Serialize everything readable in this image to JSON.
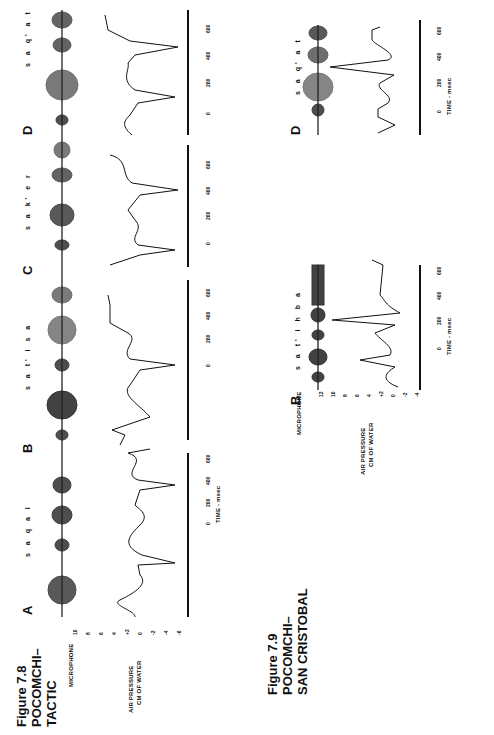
{
  "figure_7_8": {
    "title": "Figure 7.8\nPOCOMCHI–\nTACTIC",
    "microphone_label": "MICROPHONE",
    "pressure_label_1": "AIR  PRESSURE",
    "pressure_label_2": "CM OF WATER",
    "y_ticks": [
      "10",
      "8",
      "6",
      "4",
      "+2",
      "0",
      "-2",
      "-4",
      "-6"
    ],
    "time_label": "TIME - msec",
    "panels": [
      {
        "letter": "A",
        "transcription": "s a q a l",
        "time_ticks": [
          "0",
          "200",
          "400",
          "600"
        ]
      },
      {
        "letter": "B",
        "transcription": "s a t' i s a",
        "time_ticks": [
          "0",
          "200",
          "400",
          "600"
        ]
      },
      {
        "letter": "C",
        "transcription": "s a k' e r",
        "time_ticks": [
          "0",
          "200",
          "400",
          "600"
        ]
      },
      {
        "letter": "D",
        "transcription": "s a q' a t",
        "time_ticks": [
          "0",
          "200",
          "400",
          "600"
        ]
      }
    ]
  },
  "figure_7_9": {
    "title": "Figure 7.9\nPOCOMCHI–\nSAN CRISTOBAL",
    "microphone_label": "MICROPHONE",
    "pressure_label_1": "AIR  PRESSURE",
    "pressure_label_2": "CM OF WATER",
    "y_ticks": [
      "12",
      "10",
      "8",
      "6",
      "4",
      "+2",
      "0",
      "-2",
      "-4"
    ],
    "time_label": "TIME - msec",
    "panels": [
      {
        "letter": "B",
        "transcription": "s a t' i h b a",
        "time_ticks": [
          "0",
          "200",
          "400",
          "600"
        ]
      },
      {
        "letter": "D",
        "transcription": "s a q' a t",
        "time_ticks": [
          "0",
          "200",
          "400",
          "600"
        ]
      }
    ]
  }
}
